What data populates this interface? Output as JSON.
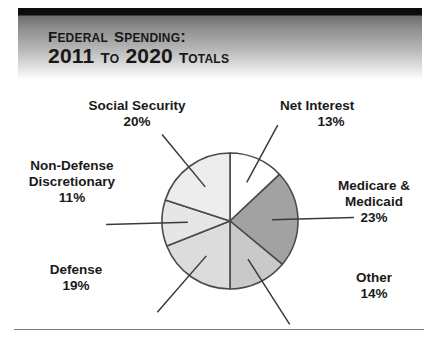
{
  "header": {
    "title_line_1": "Federal Spending:",
    "title_line_2": "2011 to 2020 Totals",
    "bar_color": "#0d0d0d",
    "gradient_from": "#6e6e6e",
    "gradient_to": "#ffffff",
    "text_color": "#181818"
  },
  "chart_data": {
    "type": "pie",
    "title": "Federal Spending: 2011 to 2020 Totals",
    "subtitle": "",
    "xlabel": "",
    "ylabel": "",
    "legend_position": "callout-labels",
    "grid": false,
    "start_angle_deg": 0,
    "direction": "clockwise",
    "units": "percent",
    "categories": [
      "Net Interest",
      "Medicare & Medicaid",
      "Other",
      "Defense",
      "Non-Defense Discretionary",
      "Social Security"
    ],
    "values": [
      13,
      23,
      14,
      19,
      11,
      20
    ],
    "value_labels": [
      "13%",
      "23%",
      "14%",
      "19%",
      "11%",
      "20%"
    ],
    "colors": [
      "#ffffff",
      "#a2a2a2",
      "#c9c9c9",
      "#dcdcdc",
      "#e6e6e6",
      "#ededed"
    ],
    "slice_outline_color": "#4a4a4a",
    "slices": [
      {
        "label": "Net Interest",
        "value": 13,
        "value_label": "13%",
        "color": "#ffffff"
      },
      {
        "label": "Medicare & Medicaid",
        "value": 23,
        "value_label": "23%",
        "color": "#a2a2a2"
      },
      {
        "label": "Other",
        "value": 14,
        "value_label": "14%",
        "color": "#c9c9c9"
      },
      {
        "label": "Defense",
        "value": 19,
        "value_label": "19%",
        "color": "#dcdcdc"
      },
      {
        "label": "Non-Defense Discretionary",
        "value": 11,
        "value_label": "11%",
        "color": "#e6e6e6"
      },
      {
        "label": "Social Security",
        "value": 20,
        "value_label": "20%",
        "color": "#ededed"
      }
    ]
  },
  "labels": {
    "social_security": {
      "name": "Social Security",
      "value": "20%"
    },
    "net_interest": {
      "name": "Net Interest",
      "value": "13%"
    },
    "non_defense_1": {
      "name": "Non-Defense"
    },
    "non_defense_2": {
      "name": "Discretionary",
      "value": "11%"
    },
    "medicare_1": {
      "name": "Medicare &"
    },
    "medicare_2": {
      "name": "Medicaid",
      "value": "23%"
    },
    "defense": {
      "name": "Defense",
      "value": "19%"
    },
    "other": {
      "name": "Other",
      "value": "14%"
    }
  }
}
